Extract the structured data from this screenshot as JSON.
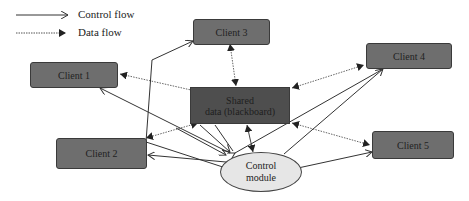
{
  "legend": {
    "control_flow": "Control flow",
    "data_flow": "Data flow"
  },
  "nodes": {
    "client1": "Client 1",
    "client2": "Client 2",
    "client3": "Client 3",
    "client4": "Client 4",
    "client5": "Client 5",
    "shared_line1": "Shared",
    "shared_line2": "data (blackboard)",
    "control_line1": "Control",
    "control_line2": "module"
  },
  "colors": {
    "client_fill": "#6e6e6e",
    "shared_fill": "#4e4e4e",
    "control_fill": "#e6e6e6",
    "line": "#333333"
  }
}
